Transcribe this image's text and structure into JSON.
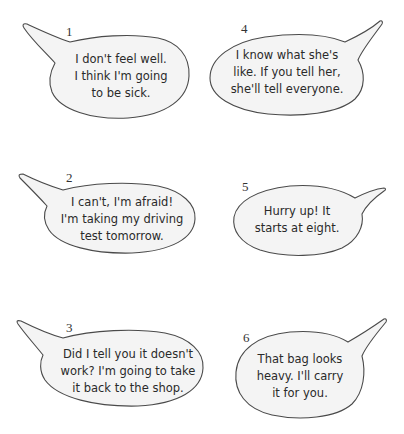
{
  "colors": {
    "bubble_fill": "#f4f4f4",
    "outline": "#4a4a4a",
    "text": "#2a2a2a"
  },
  "bubbles": [
    {
      "number": "1",
      "lines": [
        "I don't feel well.",
        "I think I'm going",
        "to be sick."
      ]
    },
    {
      "number": "2",
      "lines": [
        "I can't, I'm afraid!",
        "I'm taking my driving",
        "test tomorrow."
      ]
    },
    {
      "number": "3",
      "lines": [
        "Did I tell you it doesn't",
        "work? I'm going to take",
        "it back to the shop."
      ]
    },
    {
      "number": "4",
      "lines": [
        "I know what she's",
        "like. If you tell her,",
        "she'll tell everyone."
      ]
    },
    {
      "number": "5",
      "lines": [
        "Hurry up! It",
        "starts at eight."
      ]
    },
    {
      "number": "6",
      "lines": [
        "That bag looks",
        "heavy. I'll carry",
        "it for you."
      ]
    }
  ]
}
